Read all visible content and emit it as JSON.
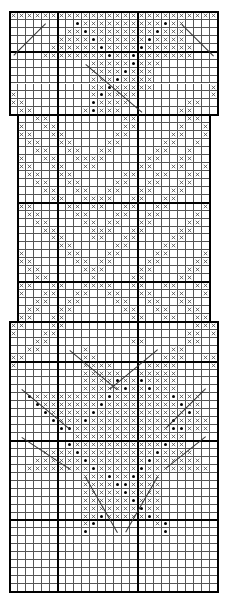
{
  "chart_title": "",
  "legend": {
    "x": "purl",
    "o": "cable-dot",
    ".": "knit",
    " ": "no-stitch"
  },
  "columns": 26,
  "thick_column_boundaries": [
    6,
    16
  ],
  "thick_row_boundaries": [
    5,
    13,
    24,
    34,
    39,
    44,
    54,
    64
  ],
  "rows": [
    "xxxxxxxxxxxxxxxxxxxxxxxxxx",
    "........oxxxxxxxxxxoxx....",
    ".......xxoxxxxxxxxoxxx....",
    "......xxxxoxxxxxxoxxxx....",
    ".....xxxxxxoxxxxoxxxxxx...",
    "....xxxxxxxxoxxoxxxxxxx...",
    "..........xxxxxoxxx.......",
    "..........xxxxoxxx........",
    "..........xxxoxxxx........",
    "..........xxoxxxxx.......x",
    "x.........xoxxxx.........x",
    "xx........oxxxx.......xx..",
    ".xx......xoxxx.......xx...",
    " ..xx.........xx......xx. ",
    " x..xx........xx.....x..x ",
    " xx..xx......xx.....xx..x ",
    " .xx..xx....xx.....xx..x. ",
    " ..xx..xx..xx.....xx..x.. ",
    " x..xx..xxxx.....xx..xx.. ",
    " xx..xx..xx.....xx..xx..x ",
    " .xx..xx......xx..xx..xx. ",
    " ..xx..xx....xx..xx..xx.. ",
    " ...xx..xx..xx..xx..xx... ",
    " ....xx..xxxx..xx..xx.... ",
    " xx....xx.xx..xx..xx....x ",
    " .xx....xx...xx..xx....x. ",
    " ..xx....xx.xx..xx....xx. ",
    " ...xx....xxx..xx....xx.. ",
    " ....xx...xx..xx....xx... ",
    " .....xx.....xx....xx.... ",
    " x.....xx...xx....xx....x ",
    " xx.....xx.xx....xx....xx ",
    " .xx.....xxx....xx....xx. ",
    " ..xx.....x....xx....xx.. ",
    " xx..xx..xxxx..xx..xx..xx ",
    " x..xx..xx..xx..xx..xx..x ",
    " ..xx..xx....xx..xx..xx.. ",
    " .xx..xx......xx..xx..xx. ",
    " xx..xx........xx..xx..xx ",
    "xx...xx................xxx",
    "x...xx................xx.x",
    "...xx..........xx.....xx..",
    "..xx.....x..........xx....",
    "xx.......xx........xxx..xx",
    "x........xxxx....xxxx....x",
    ".........xxxxx..xxxxx.....",
    ".........xxxxoxxoxxxx.....",
    ".........xxxxxoxxoxxx.....",
    "..oxxxxxxxxxoxxxxxxxoxxx..",
    "...oxxxxxxxoxxxxxxxxxoxx..",
    "....oxxxxxoxxxxxxxxxxxox..",
    ".....oxxxoxxxxxxxxxxoxxxx.",
    "......ooxxxxxxxxxxxxooxxx.",
    "........xxxxxxxxxxxxxx....",
    ".......oxxxxxxxxxxxoxx....",
    "....xxxxoxxxxxxxxxoxxxx...",
    "...xxxxxxoxxxxxxxoxxxxxx..",
    "..xxxxxxxxoxxxxxoxxxxxxxx.",
    ".........xxxoxxoxxx.......",
    ".........xxxxooxxxx.......",
    ".........xxxxxoxxxx.......",
    ".........xxxxxxoxxx.......",
    ".........xxxxxxxoxx.......",
    ".........xxoxxxxxox.......",
    ".........xo.......xo......",
    ".........o.........o......",
    "..........................",
    "..........................",
    "..........................",
    "..........................",
    "..........................",
    "..........................",
    ".........................."
  ],
  "cables": [
    {
      "r1": 1,
      "c1": 4,
      "r2": 5,
      "c2": 0
    },
    {
      "r1": 1,
      "c1": 21,
      "r2": 5,
      "c2": 25
    },
    {
      "r1": 6,
      "c1": 9,
      "r2": 12,
      "c2": 16
    },
    {
      "r1": 42,
      "c1": 7,
      "r2": 47,
      "c2": 13
    },
    {
      "r1": 42,
      "c1": 18,
      "r2": 47,
      "c2": 12
    },
    {
      "r1": 47,
      "c1": 1,
      "r2": 52,
      "c2": 7
    },
    {
      "r1": 47,
      "c1": 24,
      "r2": 52,
      "c2": 19
    },
    {
      "r1": 53,
      "c1": 1,
      "r2": 57,
      "c2": 7
    },
    {
      "r1": 53,
      "c1": 24,
      "r2": 57,
      "c2": 19
    },
    {
      "r1": 58,
      "c1": 9,
      "r2": 65,
      "c2": 13
    },
    {
      "r1": 58,
      "c1": 18,
      "r2": 65,
      "c2": 14
    }
  ]
}
